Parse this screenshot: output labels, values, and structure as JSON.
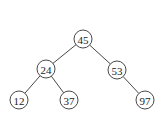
{
  "tree": {
    "nodes": [
      {
        "id": "n45",
        "value": "45",
        "x": 83,
        "y": 39
      },
      {
        "id": "n24",
        "value": "24",
        "x": 46,
        "y": 69
      },
      {
        "id": "n53",
        "value": "53",
        "x": 117,
        "y": 70
      },
      {
        "id": "n12",
        "value": "12",
        "x": 19,
        "y": 100
      },
      {
        "id": "n37",
        "value": "37",
        "x": 69,
        "y": 100
      },
      {
        "id": "n97",
        "value": "97",
        "x": 145,
        "y": 100
      }
    ],
    "edges": [
      [
        "n45",
        "n24"
      ],
      [
        "n45",
        "n53"
      ],
      [
        "n24",
        "n12"
      ],
      [
        "n24",
        "n37"
      ],
      [
        "n53",
        "n97"
      ]
    ],
    "radius": 9
  }
}
